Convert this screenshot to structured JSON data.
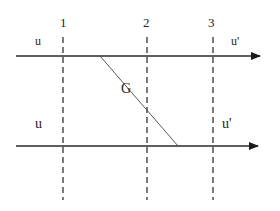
{
  "diagram": {
    "colors": {
      "line": "#2a2a2a",
      "dashed": "#333333",
      "diagonal": "#444444",
      "text": "#222222",
      "background": "#ffffff"
    },
    "section_labels": [
      "1",
      "2",
      "3"
    ],
    "top_flow": {
      "inlet_label": "u",
      "outlet_label": "u'"
    },
    "bottom_flow": {
      "inlet_label": "u",
      "outlet_label": "u'"
    },
    "diagonal_label": "G"
  }
}
